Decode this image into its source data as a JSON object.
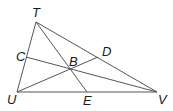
{
  "diagram": {
    "type": "triangle-with-cevians",
    "line_color": "#555555",
    "points": {
      "T": {
        "label": "T",
        "x": 36,
        "y": 22,
        "lx": 32,
        "ly": 17
      },
      "U": {
        "label": "U",
        "x": 17,
        "y": 92,
        "lx": 7,
        "ly": 104
      },
      "V": {
        "label": "V",
        "x": 157,
        "y": 92,
        "lx": 158,
        "ly": 104
      },
      "C": {
        "label": "C",
        "x": 26,
        "y": 57,
        "lx": 16,
        "ly": 61
      },
      "D": {
        "label": "D",
        "x": 98,
        "y": 57,
        "lx": 102,
        "ly": 56
      },
      "E": {
        "label": "E",
        "x": 87,
        "y": 92,
        "lx": 83,
        "ly": 105
      },
      "B": {
        "label": "B",
        "x": 70,
        "y": 69,
        "lx": 69,
        "ly": 66
      }
    },
    "segments": [
      [
        "T",
        "U"
      ],
      [
        "U",
        "V"
      ],
      [
        "V",
        "T"
      ],
      [
        "T",
        "E"
      ],
      [
        "U",
        "D"
      ],
      [
        "C",
        "V"
      ]
    ]
  }
}
